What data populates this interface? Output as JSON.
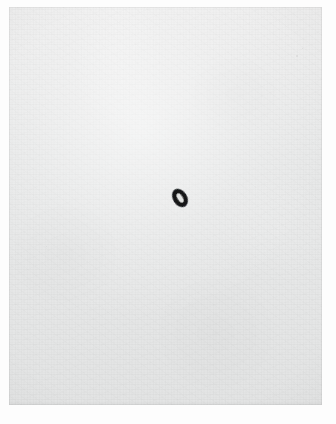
{
  "artwork": {
    "title": "Untitled (single ink ring on paper)",
    "medium": "black ink on off-white textured paper",
    "composition": "single small mark, centered horizontally, set slightly above the vertical midpoint of the sheet",
    "orientation": "portrait",
    "canvas": {
      "width_px": 336,
      "height_px": 424
    },
    "mount": {
      "label": "white photographic border",
      "color": "#fdfdfd"
    },
    "paper": {
      "label": "paper sheet",
      "base_color": "#e9eaea",
      "highlight_color": "#eeeeee",
      "shadow_color": "#e3e4e4",
      "texture": "fine fibrous grain with soft cloudy mottling",
      "left_px": 9,
      "top_px": 7,
      "width_px": 313,
      "height_px": 398
    },
    "mark": {
      "label": "ink ring mark",
      "shape": "tilted ellipse ring with a light open center",
      "ink_color": "#17181a",
      "center_color": "#e4e5e4",
      "rotation_deg": -32,
      "left_px": 168,
      "top_px": 184,
      "width_px": 24,
      "height_px": 28
    },
    "specks": [
      {
        "name": "speck-upper-right",
        "left_px": 296,
        "top_px": 55,
        "size_px": 2,
        "opacity": 0.35
      },
      {
        "name": "speck-upper-right-small",
        "left_px": 302,
        "top_px": 48,
        "size_px": 1,
        "opacity": 0.28
      },
      {
        "name": "speck-mid-left",
        "left_px": 46,
        "top_px": 246,
        "size_px": 1,
        "opacity": 0.22
      }
    ]
  }
}
